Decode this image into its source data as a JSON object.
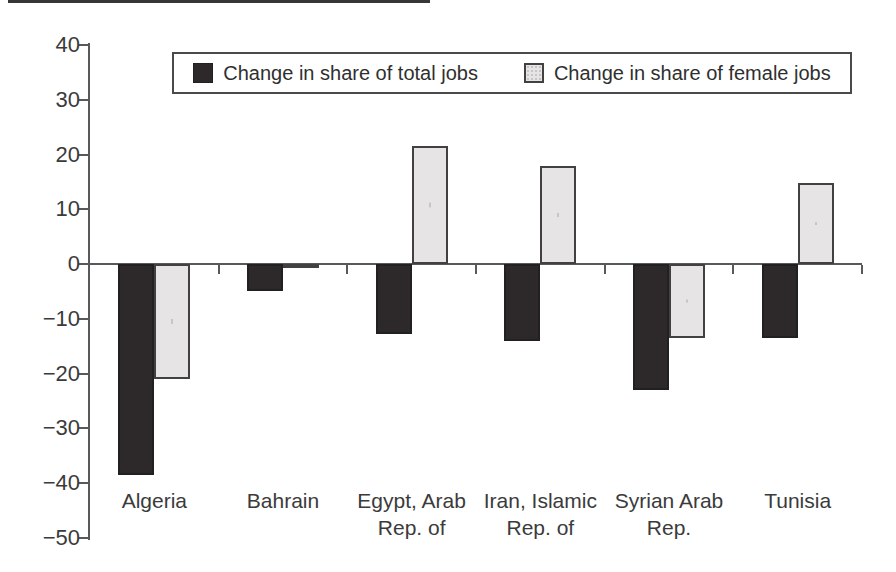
{
  "legend": {
    "items": [
      {
        "label": "Change in share of total jobs"
      },
      {
        "label": "Change in share of female jobs"
      }
    ]
  },
  "chart_data": {
    "type": "bar",
    "title": "",
    "xlabel": "",
    "ylabel": "",
    "ylim": [
      -50,
      40
    ],
    "ytick_interval": 10,
    "grid": false,
    "legend_position": "top-center",
    "categories": [
      "Algeria",
      "Bahrain",
      "Egypt, Arab Rep. of",
      "Iran, Islamic Rep. of",
      "Syrian Arab Rep.",
      "Tunisia"
    ],
    "category_label_lines": [
      [
        "Algeria"
      ],
      [
        "Bahrain"
      ],
      [
        "Egypt, Arab",
        "Rep. of"
      ],
      [
        "Iran, Islamic",
        "Rep. of"
      ],
      [
        "Syrian Arab",
        "Rep."
      ],
      [
        "Tunisia"
      ]
    ],
    "series": [
      {
        "name": "Change in share of total jobs",
        "key": "total",
        "fill": "#2d292a",
        "border": "#232021",
        "values": [
          -38.5,
          -5.0,
          -12.7,
          -14.0,
          -23.0,
          -13.5
        ]
      },
      {
        "name": "Change in share of female jobs",
        "key": "female",
        "fill": "#e6e4e5",
        "border": "#434041",
        "values": [
          -21.0,
          -0.5,
          21.5,
          18.0,
          -13.5,
          14.8
        ]
      }
    ],
    "axis_color": "#58595b",
    "text_color": "#3b3b3b"
  }
}
